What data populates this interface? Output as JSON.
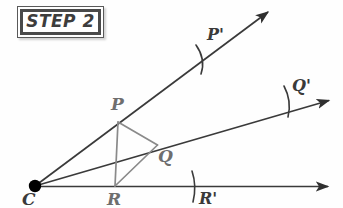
{
  "canvas": {
    "width": 343,
    "height": 208,
    "background": "#fefefe"
  },
  "badge": {
    "text": "STEP 2",
    "border_color": "#4a4a4a",
    "text_color": "#3d3d3d"
  },
  "colors": {
    "ray_stroke": "#3a3a3a",
    "triangle_stroke": "#8a8a8a",
    "arc_stroke": "#3a3a3a",
    "vertex_fill": "#000000",
    "label_gray": "#6e6e6e",
    "label_dark": "#3a3a3a"
  },
  "diagram": {
    "vertex": {
      "name": "C",
      "label": "C",
      "x": 35,
      "y": 186,
      "radius": 6
    },
    "rays": [
      {
        "name": "upper-ray",
        "label": "ray-CP-prime",
        "x1": 35,
        "y1": 186,
        "x2": 270,
        "y2": 11
      },
      {
        "name": "middle-ray",
        "label": "ray-CQ-prime",
        "x1": 35,
        "y1": 186,
        "x2": 332,
        "y2": 100
      },
      {
        "name": "horizontal-ray",
        "label": "ray-CR-prime",
        "x1": 35,
        "y1": 186,
        "x2": 332,
        "y2": 187
      }
    ],
    "points": [
      {
        "name": "P",
        "label": "P",
        "x": 118,
        "y": 122,
        "on_ray": "upper-ray",
        "style": "gray"
      },
      {
        "name": "Q",
        "label": "Q",
        "x": 157,
        "y": 145,
        "on_ray": "middle-ray",
        "style": "gray"
      },
      {
        "name": "R",
        "label": "R",
        "x": 115,
        "y": 186,
        "on_ray": "horizontal-ray",
        "style": "gray"
      },
      {
        "name": "Pp",
        "label": "P'",
        "x": 205,
        "y": 59,
        "on_ray": "upper-ray",
        "style": "dark"
      },
      {
        "name": "Qp",
        "label": "Q'",
        "x": 288,
        "y": 101,
        "on_ray": "middle-ray",
        "style": "dark"
      },
      {
        "name": "Rp",
        "label": "R'",
        "x": 194,
        "y": 186,
        "on_ray": "horizontal-ray",
        "style": "dark"
      }
    ],
    "triangle": {
      "name": "triangle-PQR",
      "vertices": [
        [
          118,
          122
        ],
        [
          157,
          145
        ],
        [
          115,
          186
        ]
      ],
      "stroke": "#8a8a8a"
    },
    "construction_marks": [
      {
        "name": "arc-tick-P-prime",
        "cx": 205,
        "cy": 59,
        "angle_deg": 55,
        "length": 30
      },
      {
        "name": "arc-tick-Q-prime",
        "cx": 288,
        "cy": 101,
        "angle_deg": 100,
        "length": 30
      },
      {
        "name": "arc-tick-R-prime",
        "cx": 194,
        "cy": 186,
        "angle_deg": 93,
        "length": 30
      }
    ]
  }
}
